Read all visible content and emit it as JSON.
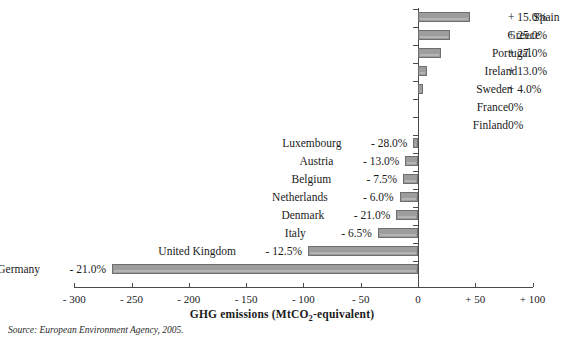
{
  "title_sliver": "",
  "source_note": "Source: European Environment Agency, 2005.",
  "axis_title_main": "GHG emissions (MtCO",
  "axis_title_sub": "2",
  "axis_title_tail": "-equivalent)",
  "colors": {
    "bar_fill": "#9d9d9d",
    "bar_border": "#6e6e6e",
    "axis": "#4a4a4a",
    "text": "#1a1a1a"
  },
  "chart_data": {
    "type": "bar",
    "orientation": "horizontal",
    "title": "",
    "xlabel": "GHG emissions (MtCO2-equivalent)",
    "ylabel": "",
    "xlim": [
      -300,
      100
    ],
    "xticks": [
      -300,
      -250,
      -200,
      -150,
      -100,
      -50,
      0,
      50,
      100
    ],
    "xtick_labels": [
      "- 300",
      "- 250",
      "- 200",
      "- 150",
      "- 100",
      "- 50",
      "0",
      "+ 50",
      "+ 100"
    ],
    "grid": false,
    "legend": "none",
    "categories": [
      "Spain",
      "Greece",
      "Portugal",
      "Ireland",
      "Sweden",
      "France",
      "Finland",
      "Luxembourg",
      "Austria",
      "Belgium",
      "Netherlands",
      "Denmark",
      "Italy",
      "United Kingdom",
      "Germany"
    ],
    "values": [
      45,
      28,
      20,
      8,
      4,
      0,
      0,
      -4,
      -11,
      -13,
      -16,
      -19,
      -35,
      -96,
      -267
    ],
    "percent_labels": [
      "+ 15.0%",
      "+ 25.0%",
      "+ 27.0%",
      "+ 13.0%",
      "+ 4.0%",
      "0%",
      "0%",
      "- 28.0%",
      "- 13.0%",
      "- 7.5%",
      "- 6.0%",
      "- 21.0%",
      "- 6.5%",
      "- 12.5%",
      "- 21.0%"
    ],
    "percent_values": [
      15.0,
      25.0,
      27.0,
      13.0,
      4.0,
      0,
      0,
      -28.0,
      -13.0,
      -7.5,
      -6.0,
      -21.0,
      -6.5,
      -12.5,
      -21.0
    ],
    "label_side": [
      "right",
      "right",
      "right",
      "right",
      "right",
      "right",
      "right",
      "left",
      "left",
      "left",
      "left",
      "left",
      "left",
      "left",
      "left"
    ]
  }
}
